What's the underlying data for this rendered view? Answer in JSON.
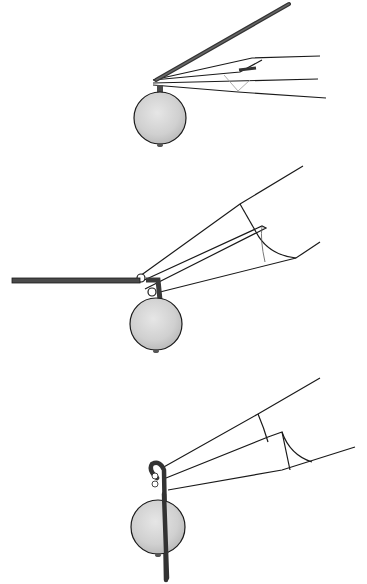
{
  "figure": {
    "type": "instructional-illustration",
    "colors": {
      "background": "#ffffff",
      "line": "#1a1a1a",
      "wire": "#4a4a4a",
      "bead_fill": "#d4d4d4",
      "bead_shadow": "#b8b8b8"
    },
    "steps": [
      {
        "index": 1,
        "description": "wire bent upward at right angle above bead, gripped by pliers tips"
      },
      {
        "index": 2,
        "description": "wire bent horizontal around pliers jaw, forming start of loop"
      },
      {
        "index": 3,
        "description": "wire wrapped around jaw to complete loop, tail pointing down across bead"
      }
    ]
  }
}
